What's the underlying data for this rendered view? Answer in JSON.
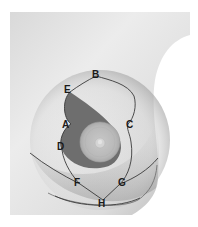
{
  "diagram": {
    "type": "surgical-marking-diagram",
    "colors": {
      "background": "#ffffff",
      "skin_light": "#e6e6e6",
      "skin_mid": "#cfcfcf",
      "skin_shadow": "#9a9a9a",
      "resection_area": "#6e6e6e",
      "areola": "#bdbdbd",
      "areola_ring": "#a8a8a8",
      "nipple": "#d6d6d6",
      "incision_line": "#3a3a3a",
      "label_text": "#1a1a1a"
    },
    "labels": [
      {
        "id": "B",
        "text": "B"
      },
      {
        "id": "E",
        "text": "E"
      },
      {
        "id": "A",
        "text": "A"
      },
      {
        "id": "C",
        "text": "C"
      },
      {
        "id": "D",
        "text": "D"
      },
      {
        "id": "F",
        "text": "F"
      },
      {
        "id": "G",
        "text": "G"
      },
      {
        "id": "H",
        "text": "H"
      }
    ]
  }
}
